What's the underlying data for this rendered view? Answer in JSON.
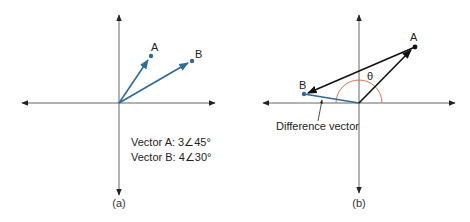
{
  "colors": {
    "axis": "#555555",
    "vector_blue": "#2e6a9a",
    "vector_black": "#111111",
    "arc": "#d9603b"
  },
  "panel_a": {
    "caption": "(a)",
    "point_a_label": "A",
    "point_b_label": "B",
    "legend": [
      "Vector A:  3∠45°",
      "Vector B:  4∠30°"
    ]
  },
  "panel_b": {
    "caption": "(b)",
    "point_a_label": "A",
    "point_b_label": "B",
    "angle_label": "θ",
    "annotation": "Difference vector"
  }
}
